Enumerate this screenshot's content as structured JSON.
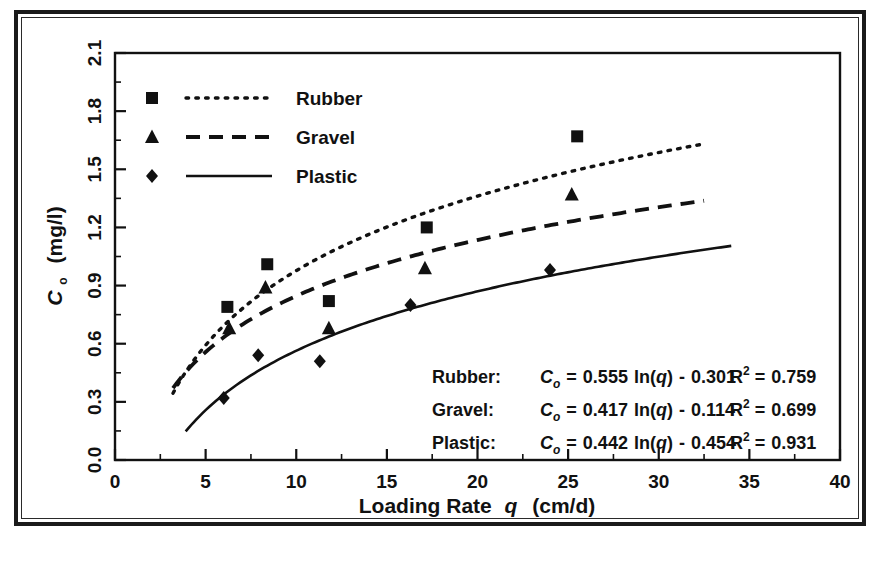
{
  "figure": {
    "border_color": "#1a1a1a",
    "ink_color": "#111111",
    "background": "#ffffff"
  },
  "axes": {
    "x_title_main": "Loading Rate",
    "x_title_var": "q",
    "x_title_unit": "(cm/d)",
    "y_title_var": "C",
    "y_title_sub": "o",
    "y_title_unit": "(mg/l)",
    "x_ticks": [
      "0",
      "5",
      "10",
      "15",
      "20",
      "25",
      "30",
      "35",
      "40"
    ],
    "y_ticks": [
      "0.0",
      "0.3",
      "0.6",
      "0.9",
      "1.2",
      "1.5",
      "1.8",
      "2.1"
    ]
  },
  "legend": {
    "entries": [
      {
        "label": "Rubber",
        "marker": "square",
        "line": "dotted"
      },
      {
        "label": "Gravel",
        "marker": "triangle",
        "line": "dashed"
      },
      {
        "label": "Plastic",
        "marker": "diamond",
        "line": "solid"
      }
    ]
  },
  "equations": [
    {
      "name": "Rubber:",
      "lhs_var": "C",
      "lhs_sub": "o",
      "eq": "=",
      "slope": "0.555",
      "fn": "ln(",
      "fnvar": "q",
      "fnclose": ")",
      "minus": "-",
      "intercept": "0.301",
      "r_label": "R",
      "r_exp": "2",
      "r_eq": "=",
      "r_value": "0.759"
    },
    {
      "name": "Gravel:",
      "lhs_var": "C",
      "lhs_sub": "o",
      "eq": "=",
      "slope": "0.417",
      "fn": "ln(",
      "fnvar": "q",
      "fnclose": ")",
      "minus": "-",
      "intercept": "0.114",
      "r_label": "R",
      "r_exp": "2",
      "r_eq": "=",
      "r_value": "0.699"
    },
    {
      "name": "Plastic:",
      "lhs_var": "C",
      "lhs_sub": "o",
      "eq": "=",
      "slope": "0.442",
      "fn": "ln(",
      "fnvar": "q",
      "fnclose": ")",
      "minus": "-",
      "intercept": "0.454",
      "r_label": "R",
      "r_exp": "2",
      "r_eq": "=",
      "r_value": "0.931"
    }
  ],
  "chart_data": {
    "type": "scatter",
    "title": "",
    "xlabel": "Loading Rate q (cm/d)",
    "ylabel": "Co (mg/l)",
    "xlim": [
      0,
      40
    ],
    "ylim": [
      0.0,
      2.1
    ],
    "x_major_step": 5,
    "x_minor_step": 2.5,
    "y_major_step": 0.3,
    "y_minor_step": 0.15,
    "grid": false,
    "legend_position": "top-left",
    "series": [
      {
        "name": "Rubber",
        "marker": "square",
        "linestyle": "dotted",
        "points": [
          {
            "x": 6.2,
            "y": 0.79
          },
          {
            "x": 8.4,
            "y": 1.01
          },
          {
            "x": 11.8,
            "y": 0.82
          },
          {
            "x": 17.2,
            "y": 1.2
          },
          {
            "x": 25.5,
            "y": 1.67
          }
        ],
        "fit": {
          "form": "a*ln(x)+b",
          "a": 0.555,
          "b": -0.301,
          "r2": 0.759
        },
        "fit_x_range": [
          3.2,
          32.5
        ]
      },
      {
        "name": "Gravel",
        "marker": "triangle",
        "linestyle": "dashed",
        "points": [
          {
            "x": 6.3,
            "y": 0.68
          },
          {
            "x": 8.3,
            "y": 0.89
          },
          {
            "x": 11.8,
            "y": 0.68
          },
          {
            "x": 17.1,
            "y": 0.99
          },
          {
            "x": 25.2,
            "y": 1.37
          }
        ],
        "fit": {
          "form": "a*ln(x)+b",
          "a": 0.417,
          "b": -0.114,
          "r2": 0.699
        },
        "fit_x_range": [
          3.2,
          32.5
        ]
      },
      {
        "name": "Plastic",
        "marker": "diamond",
        "linestyle": "solid",
        "points": [
          {
            "x": 6.0,
            "y": 0.32
          },
          {
            "x": 7.9,
            "y": 0.54
          },
          {
            "x": 11.3,
            "y": 0.51
          },
          {
            "x": 16.3,
            "y": 0.8
          },
          {
            "x": 24.0,
            "y": 0.98
          }
        ],
        "fit": {
          "form": "a*ln(x)+b",
          "a": 0.442,
          "b": -0.454,
          "r2": 0.931
        },
        "fit_x_range": [
          3.9,
          34.0
        ]
      }
    ]
  }
}
